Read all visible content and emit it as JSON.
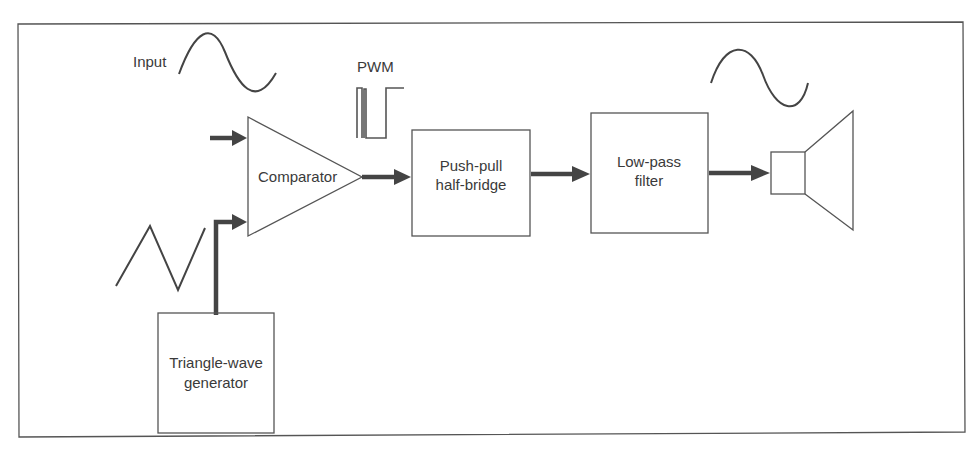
{
  "figure": {
    "labels": {
      "input": "Input",
      "pwm": "PWM"
    },
    "blocks": {
      "comparator": "Comparator",
      "pushpull": [
        "Push-pull",
        "half-bridge"
      ],
      "lowpass": [
        "Low-pass",
        "filter"
      ],
      "triangle": [
        "Triangle-wave",
        "generator"
      ],
      "speaker": "speaker"
    },
    "colors": {
      "line": "#444444",
      "frame": "#555555",
      "background": "#ffffff"
    }
  }
}
